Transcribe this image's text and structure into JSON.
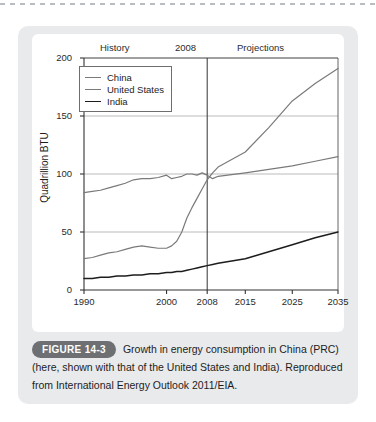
{
  "figure": {
    "badge": "FIGURE 14-3",
    "caption": "Growth in energy consumption in China (PRC) (here, shown with that of the United States and India). Reproduced from International Energy Outlook 2011/EIA."
  },
  "bands": {
    "history": "History",
    "divider": "2008",
    "projections": "Projections"
  },
  "legend": {
    "items": [
      {
        "label": "China",
        "color": "#7a7a7a"
      },
      {
        "label": "United States",
        "color": "#7a7a7a"
      },
      {
        "label": "India",
        "color": "#1d1d1d"
      }
    ]
  },
  "chart_data": {
    "type": "line",
    "title": "",
    "xlabel": "",
    "ylabel": "Quadrillion BTU",
    "ylim": [
      0,
      200
    ],
    "yticks": [
      0,
      50,
      100,
      150,
      200
    ],
    "xticks": [
      1990,
      2000,
      2008,
      2015,
      2025,
      2035
    ],
    "xtick_positions": [
      0,
      32.5,
      48.5,
      63.5,
      82.0,
      100.0
    ],
    "grid": "horizontal",
    "legend_position": "top-left-inside",
    "divider_year": 2008,
    "annotations": [
      {
        "text": "History",
        "x": 1997
      },
      {
        "text": "2008",
        "x": 2008
      },
      {
        "text": "Projections",
        "x": 2022
      }
    ],
    "x": [
      1990,
      1991,
      1992,
      1993,
      1994,
      1995,
      1996,
      1997,
      1998,
      1999,
      2000,
      2001,
      2002,
      2003,
      2004,
      2005,
      2006,
      2007,
      2008,
      2009,
      2010,
      2015,
      2020,
      2025,
      2030,
      2035
    ],
    "series": [
      {
        "name": "China",
        "color": "#7a7a7a",
        "values": [
          27,
          28,
          30,
          32,
          33,
          35,
          37,
          38,
          37,
          36,
          36,
          38,
          42,
          50,
          62,
          71,
          79,
          87,
          95,
          101,
          106,
          119,
          140,
          163,
          178,
          191
        ]
      },
      {
        "name": "United States",
        "color": "#7a7a7a",
        "values": [
          84,
          85,
          86,
          88,
          90,
          92,
          95,
          96,
          96,
          97,
          99,
          96,
          97,
          98,
          100,
          100,
          99,
          101,
          99,
          96,
          98,
          101,
          104,
          107,
          111,
          115
        ]
      },
      {
        "name": "India",
        "color": "#1d1d1d",
        "values": [
          10,
          10,
          11,
          11,
          12,
          12,
          13,
          13,
          14,
          14,
          15,
          15,
          16,
          16,
          17,
          18,
          19,
          20,
          21,
          22,
          23,
          27,
          33,
          39,
          45,
          50
        ]
      }
    ]
  }
}
